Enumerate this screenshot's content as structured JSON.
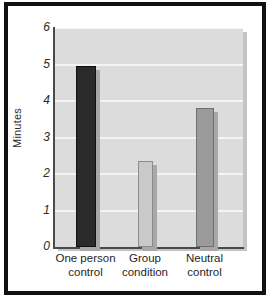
{
  "figure": {
    "frame_color": "#111111",
    "background": "#ffffff"
  },
  "chart_data": {
    "type": "bar",
    "title": "",
    "xlabel": "",
    "ylabel": "Minutes",
    "categories": [
      "One person control",
      "Group condition",
      "Neutral control"
    ],
    "category_lines": [
      [
        "One person",
        "control"
      ],
      [
        "Group",
        "condition"
      ],
      [
        "Neutral",
        "control"
      ]
    ],
    "values": [
      4.95,
      2.35,
      3.8
    ],
    "ylim": [
      0,
      6
    ],
    "yticks": [
      0,
      1,
      2,
      3,
      4,
      5,
      6
    ],
    "ytick_labels": [
      "0",
      "1",
      "2",
      "3",
      "4",
      "5",
      "6"
    ],
    "grid": true,
    "legend": "none",
    "bar_colors": [
      "#2a2a2a",
      "#c9c9c9",
      "#9b9b9b"
    ],
    "bar_edge_colors": [
      "#111111",
      "#8a8a8a",
      "#6f6f6f"
    ],
    "plot_background": "#dcdcdc",
    "gridline_color": "#f4f4f4",
    "axis_color": "#4a4a4a"
  }
}
